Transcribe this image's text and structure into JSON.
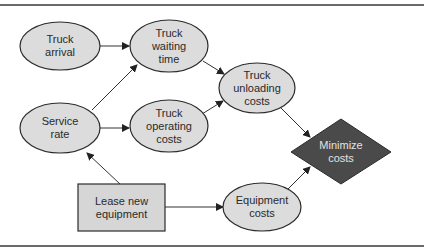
{
  "diagram": {
    "title": "",
    "colors": {
      "ellipse_fill": "#dcdcdc",
      "rect_fill": "#d6d6d6",
      "diamond_fill": "#4a4a4a",
      "stroke": "#2b2b2b",
      "text": "#2a2a2a",
      "diamond_text": "#e2e2e2"
    },
    "nodes": {
      "truck_arrival": {
        "shape": "ellipse",
        "lines": [
          "Truck",
          "arrival"
        ]
      },
      "truck_waiting_time": {
        "shape": "ellipse",
        "lines": [
          "Truck",
          "waiting",
          "time"
        ]
      },
      "service_rate": {
        "shape": "ellipse",
        "lines": [
          "Service",
          "rate"
        ]
      },
      "truck_operating_costs": {
        "shape": "ellipse",
        "lines": [
          "Truck",
          "operating",
          "costs"
        ]
      },
      "truck_unloading_costs": {
        "shape": "ellipse",
        "lines": [
          "Truck",
          "unloading",
          "costs"
        ]
      },
      "lease_new_equipment": {
        "shape": "rectangle",
        "lines": [
          "Lease new",
          "equipment"
        ]
      },
      "equipment_costs": {
        "shape": "ellipse",
        "lines": [
          "Equipment",
          "costs"
        ]
      },
      "minimize_costs": {
        "shape": "diamond",
        "lines": [
          "Minimize",
          "costs"
        ]
      }
    },
    "edges": [
      {
        "from": "Truck arrival",
        "to": "Truck waiting time"
      },
      {
        "from": "Service rate",
        "to": "Truck waiting time"
      },
      {
        "from": "Service rate",
        "to": "Truck operating costs"
      },
      {
        "from": "Truck waiting time",
        "to": "Truck unloading costs"
      },
      {
        "from": "Truck operating costs",
        "to": "Truck unloading costs"
      },
      {
        "from": "Lease new equipment",
        "to": "Service rate"
      },
      {
        "from": "Lease new equipment",
        "to": "Equipment costs"
      },
      {
        "from": "Truck unloading costs",
        "to": "Minimize costs"
      },
      {
        "from": "Equipment costs",
        "to": "Minimize costs"
      }
    ]
  }
}
